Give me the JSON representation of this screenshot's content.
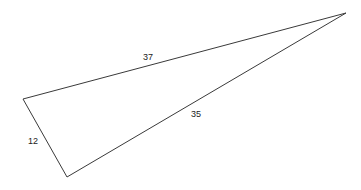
{
  "diagram": {
    "type": "triangle",
    "vertices": {
      "A": {
        "x": 23,
        "y": 99
      },
      "B": {
        "x": 67,
        "y": 177
      },
      "C": {
        "x": 346,
        "y": 13
      }
    },
    "sides": [
      {
        "from": "A",
        "to": "C",
        "label": "37",
        "label_pos": {
          "x": 148,
          "y": 60
        }
      },
      {
        "from": "B",
        "to": "C",
        "label": "35",
        "label_pos": {
          "x": 196,
          "y": 117
        }
      },
      {
        "from": "A",
        "to": "B",
        "label": "12",
        "label_pos": {
          "x": 33,
          "y": 144
        }
      }
    ],
    "stroke_color": "#3a3a3a"
  }
}
